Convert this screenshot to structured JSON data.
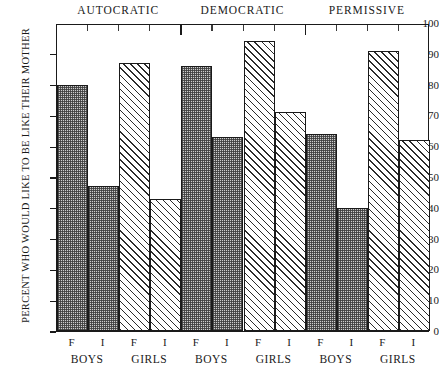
{
  "chart_data": {
    "type": "bar",
    "title": "",
    "xlabel": "",
    "ylabel": "PERCENT WHO WOULD LIKE TO BE LIKE THEIR MOTHER",
    "ylim": [
      0,
      100
    ],
    "yticks": [
      0,
      10,
      20,
      30,
      40,
      50,
      60,
      70,
      80,
      90,
      100
    ],
    "grid": false,
    "legend_position": "none",
    "group_labels": [
      "AUTOCRATIC",
      "DEMOCRATIC",
      "PERMISSIVE"
    ],
    "subgroup_labels": [
      "BOYS",
      "GIRLS",
      "BOYS",
      "GIRLS",
      "BOYS",
      "GIRLS"
    ],
    "categories": [
      "F",
      "I",
      "F",
      "I",
      "F",
      "I",
      "F",
      "I",
      "F",
      "I",
      "F",
      "I"
    ],
    "values": [
      80,
      47,
      87,
      43,
      86,
      63,
      94,
      71,
      64,
      40,
      91,
      62
    ],
    "bars": [
      {
        "group": "AUTOCRATIC",
        "subgroup": "BOYS",
        "category": "F",
        "value": 80,
        "fill": "dotted"
      },
      {
        "group": "AUTOCRATIC",
        "subgroup": "BOYS",
        "category": "I",
        "value": 47,
        "fill": "dotted"
      },
      {
        "group": "AUTOCRATIC",
        "subgroup": "GIRLS",
        "category": "F",
        "value": 87,
        "fill": "hatched"
      },
      {
        "group": "AUTOCRATIC",
        "subgroup": "GIRLS",
        "category": "I",
        "value": 43,
        "fill": "hatched"
      },
      {
        "group": "DEMOCRATIC",
        "subgroup": "BOYS",
        "category": "F",
        "value": 86,
        "fill": "dotted"
      },
      {
        "group": "DEMOCRATIC",
        "subgroup": "BOYS",
        "category": "I",
        "value": 63,
        "fill": "dotted"
      },
      {
        "group": "DEMOCRATIC",
        "subgroup": "GIRLS",
        "category": "F",
        "value": 94,
        "fill": "hatched"
      },
      {
        "group": "DEMOCRATIC",
        "subgroup": "GIRLS",
        "category": "I",
        "value": 71,
        "fill": "hatched"
      },
      {
        "group": "PERMISSIVE",
        "subgroup": "BOYS",
        "category": "F",
        "value": 64,
        "fill": "dotted"
      },
      {
        "group": "PERMISSIVE",
        "subgroup": "BOYS",
        "category": "I",
        "value": 40,
        "fill": "dotted"
      },
      {
        "group": "PERMISSIVE",
        "subgroup": "GIRLS",
        "category": "F",
        "value": 91,
        "fill": "hatched"
      },
      {
        "group": "PERMISSIVE",
        "subgroup": "GIRLS",
        "category": "I",
        "value": 62,
        "fill": "hatched"
      }
    ],
    "colors": {
      "axis": "#1a1a1a",
      "dotted_fill": "#cdcdcd",
      "hatched_fill": "#ffffff",
      "outline": "#1a1a1a"
    }
  }
}
